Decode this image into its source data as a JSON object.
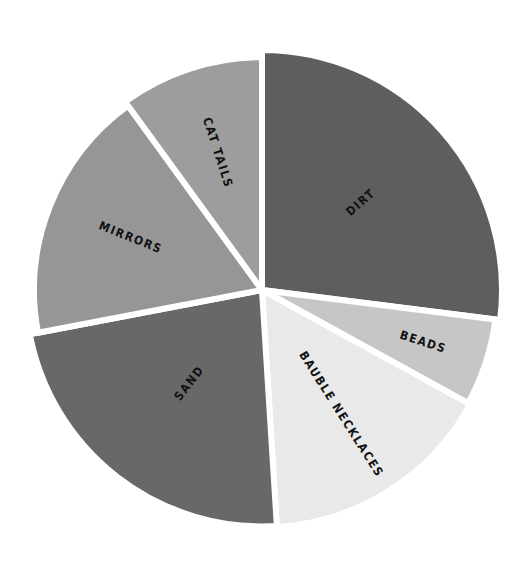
{
  "chart_data": {
    "type": "pie",
    "title": "",
    "legend": "none (labels drawn inside slices)",
    "start_angle_deg": 0,
    "direction": "clockwise",
    "slices": [
      {
        "label": "DIRT",
        "value": 27,
        "color": "#5e5e5e"
      },
      {
        "label": "BEADS",
        "value": 6,
        "color": "#c6c6c6"
      },
      {
        "label": "BAUBLE NECKLACES",
        "value": 16,
        "color": "#e9e9e9"
      },
      {
        "label": "SAND",
        "value": 23,
        "color": "#686868"
      },
      {
        "label": "MIRRORS",
        "value": 18,
        "color": "#969696"
      },
      {
        "label": "CAT TAILS",
        "value": 10,
        "color": "#9d9d9d"
      }
    ],
    "categories": [
      "DIRT",
      "BEADS",
      "BAUBLE NECKLACES",
      "SAND",
      "MIRRORS",
      "CAT TAILS"
    ],
    "values": [
      27,
      6,
      16,
      23,
      18,
      10
    ],
    "units": "approximate percent of whole"
  },
  "layout": {
    "center_x": 262,
    "center_y": 290,
    "radius": 240,
    "gap_color": "#ffffff",
    "gap_width": 6
  }
}
